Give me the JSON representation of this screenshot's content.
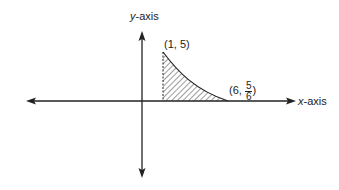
{
  "diagram": {
    "y_axis_label_var": "y",
    "y_axis_label_suffix": "-axis",
    "x_axis_label_var": "x",
    "x_axis_label_suffix": "-axis",
    "point_start": {
      "label": "(1, 5)",
      "x": 1,
      "y": 5
    },
    "point_end": {
      "prefix": "(6, ",
      "numerator": "5",
      "denominator": "6",
      "suffix": ")",
      "x": 6,
      "y": "5/6"
    },
    "shaded_region": "area under curve y = 5/x from x = 1 to x = 6",
    "colors": {
      "stroke": "#222222",
      "background": "#ffffff"
    }
  }
}
